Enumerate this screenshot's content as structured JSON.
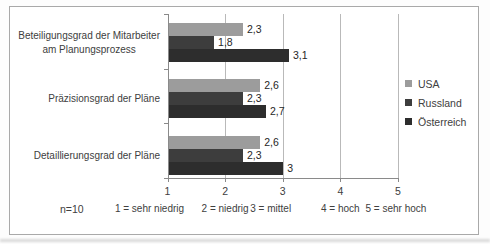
{
  "chart_data": {
    "type": "bar",
    "orientation": "horizontal",
    "title": "",
    "categories": [
      "Beteiligungsgrad der Mitarbeiter am Planungsprozess",
      "Präzisionsgrad der Pläne",
      "Detaillierungsgrad der Pläne"
    ],
    "category_lines": [
      [
        "Beteiligungsgrad der Mitarbeiter",
        "am Planungsprozess"
      ],
      [
        "Präzisionsgrad der Pläne"
      ],
      [
        "Detaillierungsgrad der Pläne"
      ]
    ],
    "series": [
      {
        "name": "USA",
        "color": "#9c9c9c",
        "values": [
          2.3,
          2.6,
          2.6
        ],
        "value_labels": [
          "2,3",
          "2,6",
          "2,6"
        ]
      },
      {
        "name": "Russland",
        "color": "#3d3d3d",
        "values": [
          1.8,
          2.3,
          2.3
        ],
        "value_labels": [
          "1,8",
          "2,3",
          "2,3"
        ]
      },
      {
        "name": "Österreich",
        "color": "#2d2d2d",
        "values": [
          3.1,
          2.7,
          3.0
        ],
        "value_labels": [
          "3,1",
          "2,7",
          "3"
        ]
      }
    ],
    "xlim": [
      1,
      5
    ],
    "x_tick_labels": [
      "1",
      "2",
      "3",
      "4",
      "5"
    ],
    "scale_legend": [
      "1 = sehr niedrig",
      "2 = niedrig",
      "3 = mittel",
      "4 = hoch",
      "5 = sehr hoch"
    ],
    "legend": {
      "position": "right",
      "entries": [
        "USA",
        "Russland",
        "Österreich"
      ]
    },
    "grid": true,
    "note": "n=10",
    "colors": {
      "gridline": "#b9b9b9",
      "axis": "#8a8a8a",
      "text": "#404040",
      "frame_border": "#a9a9a9"
    }
  }
}
